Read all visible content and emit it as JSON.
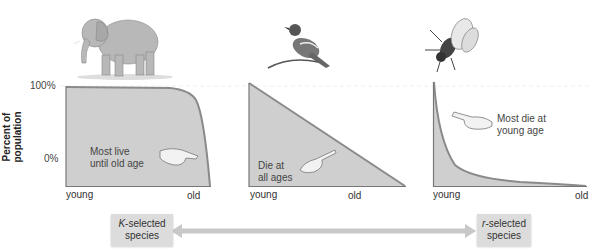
{
  "y_axis": {
    "label_line1": "Percent of",
    "label_line2": "population",
    "tick_top": "100%",
    "tick_bottom": "0%"
  },
  "panels": [
    {
      "animal": "elephant",
      "note_line1": "Most live",
      "note_line2": "until old age",
      "x_start": "young",
      "x_end": "old",
      "curve_type": "Type I"
    },
    {
      "animal": "bird",
      "note_line1": "Die at",
      "note_line2": "all ages",
      "x_start": "young",
      "x_end": "old",
      "curve_type": "Type II"
    },
    {
      "animal": "fly",
      "note_line1": "Most die at",
      "note_line2": "young age",
      "x_start": "young",
      "x_end": "old",
      "curve_type": "Type III"
    }
  ],
  "spectrum": {
    "left_italic": "K",
    "left_rest": "-selected",
    "left_line2": "species",
    "right_italic": "r",
    "right_rest": "-selected",
    "right_line2": "species"
  },
  "colors": {
    "fill": "#cfcfcf",
    "curve": "#8a8a8a",
    "arrow": "#c8c8c8"
  }
}
